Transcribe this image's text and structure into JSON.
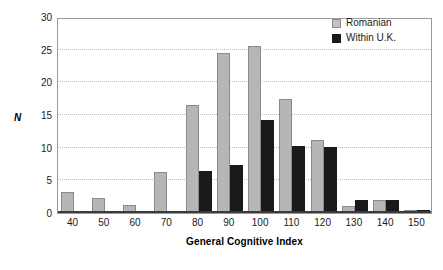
{
  "chart_data": {
    "type": "bar",
    "title": "",
    "xlabel": "General Cognitive Index",
    "ylabel": "N",
    "categories": [
      "40",
      "50",
      "60",
      "70",
      "80",
      "90",
      "100",
      "110",
      "120",
      "130",
      "140",
      "150"
    ],
    "series": [
      {
        "name": "Romanian",
        "color": "#b6b6b6",
        "values": [
          3.2,
          2.3,
          1.3,
          6.3,
          16.5,
          24.5,
          25.5,
          17.4,
          11.1,
          1.1,
          2.0,
          0.4
        ]
      },
      {
        "name": "Within U.K.",
        "color": "#1a1a1a",
        "values": [
          0.3,
          0.3,
          0.3,
          0.3,
          6.4,
          7.4,
          14.3,
          10.3,
          10.1,
          2.0,
          2.0,
          0.4
        ]
      }
    ],
    "ylim": [
      0,
      30
    ],
    "yticks": [
      0,
      5,
      10,
      15,
      20,
      25,
      30
    ],
    "ytick_labels": [
      "0",
      "5",
      "10",
      "15",
      "20",
      "25",
      "30"
    ],
    "grid": true,
    "grid_axis": "y",
    "legend_position": "top-right",
    "legend_entries": [
      "Romanian",
      "Within U.K."
    ]
  }
}
